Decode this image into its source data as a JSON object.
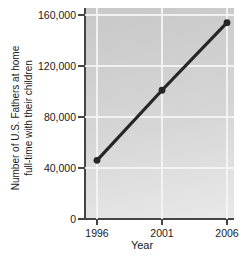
{
  "figure": {
    "x_axis_title": "Year",
    "y_axis_title_line1": "Number of U.S. Fathers at home",
    "y_axis_title_line2": "full-time with their children"
  },
  "chart_data": {
    "type": "line",
    "title": "",
    "x": [
      1996,
      2001,
      2006
    ],
    "categories": [
      "1996",
      "2001",
      "2006"
    ],
    "series": [
      {
        "name": "Fathers at home full-time",
        "values": [
          46000,
          101000,
          154000
        ]
      }
    ],
    "xlabel": "Year",
    "ylabel": "Number of U.S. Fathers at home full-time with their children",
    "ylabel_lines": [
      "Number of U.S. Fathers at home",
      "full-time with their children"
    ],
    "ylim": [
      0,
      160000
    ],
    "yticks": [
      0,
      40000,
      80000,
      120000,
      160000
    ],
    "ytick_labels": [
      "0",
      "40,000",
      "80,000",
      "120,000",
      "160,000"
    ],
    "grid": true,
    "legend": "none",
    "marker": "point",
    "colors": {
      "line": "#262626",
      "marker": "#262626",
      "grid": "#f4f4f4",
      "axis": "#454545",
      "text": "#1a1a1a",
      "plot_bg_top": "#c8c8c8",
      "plot_bg_bottom": "#e9e9e9"
    }
  }
}
